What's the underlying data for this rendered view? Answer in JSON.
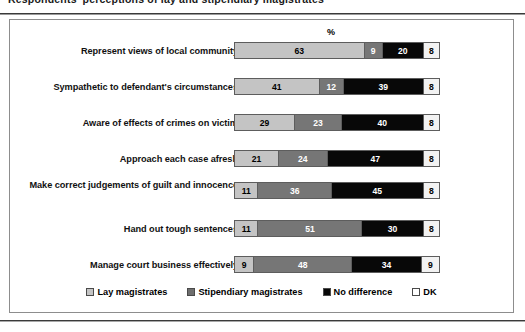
{
  "page": {
    "clipped_heading": "Respondents' perceptions of lay and stipendiary magistrates"
  },
  "axis": {
    "unit_label": "%"
  },
  "legend": {
    "items": [
      {
        "label": "Lay magistrates",
        "swatch": "lay-magistrates-swatch",
        "color": "#c4c4c4"
      },
      {
        "label": "Stipendiary magistrates",
        "swatch": "stipendiary-magistrates-swatch",
        "color": "#6e6e6e"
      },
      {
        "label": "No difference",
        "swatch": "no-difference-swatch",
        "color": "#080808"
      },
      {
        "label": "DK",
        "swatch": "dk-swatch",
        "color": "#ffffff"
      }
    ]
  },
  "chart_data": {
    "type": "bar",
    "orientation": "horizontal",
    "stacked": true,
    "normalized": true,
    "title": "",
    "xlabel": "%",
    "ylabel": "",
    "xlim": [
      0,
      100
    ],
    "grid": false,
    "legend_position": "bottom",
    "categories": [
      "Represent views of local community",
      "Sympathetic to defendant's circumstances",
      "Aware of effects of crimes on victim",
      "Approach each case afresh",
      "Make correct judgements of guilt and innocence",
      "Hand out tough sentences",
      "Manage court business effectively"
    ],
    "series": [
      {
        "name": "Lay magistrates",
        "values": [
          63,
          41,
          29,
          21,
          11,
          11,
          9
        ]
      },
      {
        "name": "Stipendiary magistrates",
        "values": [
          9,
          12,
          23,
          24,
          36,
          51,
          48
        ]
      },
      {
        "name": "No difference",
        "values": [
          20,
          39,
          40,
          47,
          45,
          30,
          34
        ]
      },
      {
        "name": "DK",
        "values": [
          8,
          8,
          8,
          8,
          8,
          8,
          9
        ]
      }
    ],
    "rows": [
      {
        "category": "Represent views of local community",
        "lay": 63,
        "stipendiary": 9,
        "no_difference": 20,
        "dk": 8
      },
      {
        "category": "Sympathetic to defendant's circumstances",
        "lay": 41,
        "stipendiary": 12,
        "no_difference": 39,
        "dk": 8
      },
      {
        "category": "Aware of effects of crimes on victim",
        "lay": 29,
        "stipendiary": 23,
        "no_difference": 40,
        "dk": 8
      },
      {
        "category": "Approach each case afresh",
        "lay": 21,
        "stipendiary": 24,
        "no_difference": 47,
        "dk": 8
      },
      {
        "category": "Make correct judgements of guilt and innocence",
        "lay": 11,
        "stipendiary": 36,
        "no_difference": 45,
        "dk": 8
      },
      {
        "category": "Hand out tough sentences",
        "lay": 11,
        "stipendiary": 51,
        "no_difference": 30,
        "dk": 8
      },
      {
        "category": "Manage court business effectively",
        "lay": 9,
        "stipendiary": 48,
        "no_difference": 34,
        "dk": 9
      }
    ]
  }
}
